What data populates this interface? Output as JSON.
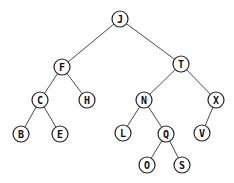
{
  "diagram": {
    "type": "binary-search-tree",
    "root": "J",
    "node_radius": 8,
    "colors": {
      "background": "#ffffff",
      "edge": "#4a4a4a",
      "node_stroke": "#222222",
      "node_fill": "#ffffff",
      "label": "#111111"
    },
    "nodes": [
      {
        "id": "J",
        "label": "J",
        "x": 120,
        "y": 19
      },
      {
        "id": "F",
        "label": "F",
        "x": 62,
        "y": 67
      },
      {
        "id": "T",
        "label": "T",
        "x": 181,
        "y": 64
      },
      {
        "id": "C",
        "label": "C",
        "x": 40,
        "y": 100
      },
      {
        "id": "H",
        "label": "H",
        "x": 87,
        "y": 100
      },
      {
        "id": "N",
        "label": "N",
        "x": 144,
        "y": 100
      },
      {
        "id": "X",
        "label": "X",
        "x": 216,
        "y": 100
      },
      {
        "id": "B",
        "label": "B",
        "x": 21,
        "y": 134
      },
      {
        "id": "E",
        "label": "E",
        "x": 60,
        "y": 134
      },
      {
        "id": "L",
        "label": "L",
        "x": 123,
        "y": 133
      },
      {
        "id": "Q",
        "label": "Q",
        "x": 166,
        "y": 134
      },
      {
        "id": "V",
        "label": "V",
        "x": 202,
        "y": 133
      },
      {
        "id": "O",
        "label": "O",
        "x": 147,
        "y": 165
      },
      {
        "id": "S",
        "label": "S",
        "x": 182,
        "y": 165
      }
    ],
    "edges": [
      {
        "from": "J",
        "to": "F"
      },
      {
        "from": "J",
        "to": "T"
      },
      {
        "from": "F",
        "to": "C"
      },
      {
        "from": "F",
        "to": "H"
      },
      {
        "from": "C",
        "to": "B"
      },
      {
        "from": "C",
        "to": "E"
      },
      {
        "from": "T",
        "to": "N"
      },
      {
        "from": "T",
        "to": "X"
      },
      {
        "from": "N",
        "to": "L"
      },
      {
        "from": "N",
        "to": "Q"
      },
      {
        "from": "Q",
        "to": "O"
      },
      {
        "from": "Q",
        "to": "S"
      },
      {
        "from": "X",
        "to": "V"
      }
    ]
  }
}
